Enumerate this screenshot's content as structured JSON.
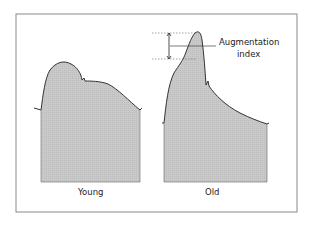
{
  "diagram": {
    "panels": [
      {
        "label": "Young",
        "description": "Pulse waveform with rounded systolic peak and late dicrotic notch"
      },
      {
        "label": "Old",
        "description": "Pulse waveform with augmented late systolic peak"
      }
    ],
    "annotation": {
      "line1": "Augmentation",
      "line2": "index"
    },
    "colors": {
      "fill": "#c8c8c8",
      "stroke": "#333333",
      "frame": "#888888"
    }
  }
}
